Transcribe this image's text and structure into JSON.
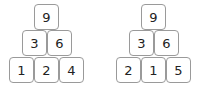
{
  "pyramids": [
    {
      "top": "9",
      "middle": [
        "3",
        "6"
      ],
      "bottom": [
        "1",
        "2",
        "4"
      ]
    },
    {
      "top": "9",
      "middle": [
        "3",
        "6"
      ],
      "bottom": [
        "2",
        "1",
        "5"
      ]
    }
  ]
}
